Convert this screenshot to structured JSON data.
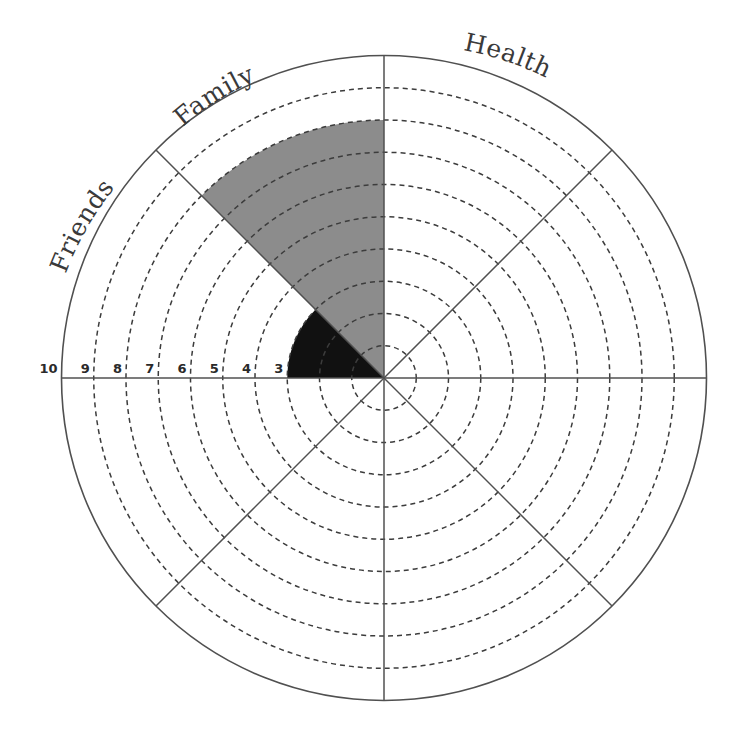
{
  "chart_data": {
    "type": "polar-wheel",
    "title": "",
    "scale": {
      "min": 0,
      "max": 10,
      "rings": 10,
      "outer_ring_solid": true,
      "inner_rings_dashed": true
    },
    "ring_labels": [
      "10",
      "9",
      "8",
      "7",
      "6",
      "5",
      "4",
      "3"
    ],
    "segments": [
      {
        "label": "Health",
        "start_deg": 90,
        "end_deg": 45,
        "value": null
      },
      {
        "label": "",
        "start_deg": 45,
        "end_deg": 0,
        "value": null
      },
      {
        "label": "",
        "start_deg": 0,
        "end_deg": -45,
        "value": null
      },
      {
        "label": "",
        "start_deg": -45,
        "end_deg": -90,
        "value": null
      },
      {
        "label": "",
        "start_deg": -90,
        "end_deg": -135,
        "value": null
      },
      {
        "label": "",
        "start_deg": -135,
        "end_deg": -180,
        "value": null
      },
      {
        "label": "Friends",
        "start_deg": 180,
        "end_deg": 135,
        "value": 3,
        "fill": "#111111"
      },
      {
        "label": "Family",
        "start_deg": 135,
        "end_deg": 90,
        "value": 8,
        "fill": "#8c8c8c"
      }
    ],
    "visible_labels": [
      "Family",
      "Health",
      "Friends"
    ],
    "grid": true,
    "legend": null
  },
  "style": {
    "line_color": "#505050",
    "dash_color": "#3c3c3c",
    "filled_colors": {
      "Family": "#8c8c8c",
      "Friends": "#111111"
    }
  }
}
